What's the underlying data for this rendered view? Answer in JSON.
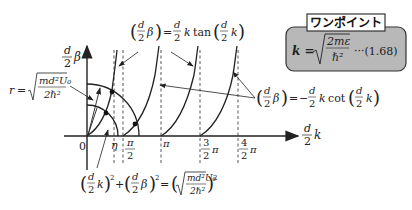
{
  "diagram": {
    "colors": {
      "line": "#222222",
      "box_fill": "#b8b8b8",
      "box_stroke": "#333333",
      "label_bg": "#ffffff"
    },
    "axes": {
      "y_label_num": "d",
      "y_label_den": "2",
      "y_label_var": "β",
      "x_label_num": "d",
      "x_label_den": "2",
      "x_label_var": "k",
      "origin": "0"
    },
    "x_ticks": [
      {
        "id": "eta",
        "label": "η"
      },
      {
        "id": "half_pi",
        "num": "π",
        "den": "2"
      },
      {
        "id": "pi",
        "label": "π"
      },
      {
        "id": "three_half_pi",
        "num": "3",
        "den": "2",
        "suffix": "π"
      },
      {
        "id": "four_half_pi",
        "num": "4",
        "den": "2",
        "suffix": "π"
      }
    ],
    "annotations": {
      "tan_eq": {
        "lhs": "(d/2 β)",
        "rhs": "= d/2 k tan(d/2 k)"
      },
      "cot_eq": {
        "lhs": "(d/2 β)",
        "rhs": "= − d/2 k cot(d/2 k)"
      },
      "radius": {
        "lhs": "r =",
        "num": "md²U₀",
        "den": "2ℏ²"
      },
      "circle_eq": {
        "text": "(d/2 k)² + (d/2 β)² = (√(md²U₀ / 2ℏ²))²"
      }
    },
    "onepoint_box": {
      "title": "ワンポイント",
      "lhs": "k =",
      "num": "2mε",
      "den": "ℏ²",
      "ref": "···(1.68)"
    }
  }
}
